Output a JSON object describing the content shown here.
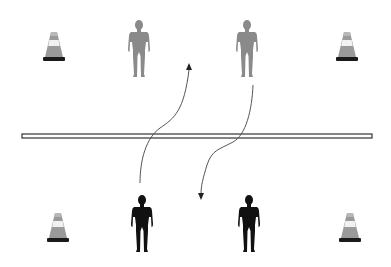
{
  "diagram": {
    "colors": {
      "background": "#ffffff",
      "player_top": "#8a8a8a",
      "player_bottom": "#111111",
      "net_fill": "#ffffff",
      "net_stroke": "#333333",
      "path": "#555555",
      "cone_base": "#1a1a1a",
      "cone_body": "#9a9a9a",
      "cone_band": "#f2f2f2"
    },
    "cones": [
      {
        "id": "top-left",
        "x": 54,
        "y": 48
      },
      {
        "id": "top-right",
        "x": 347,
        "y": 48
      },
      {
        "id": "bottom-left",
        "x": 58,
        "y": 229
      },
      {
        "id": "bottom-right",
        "x": 350,
        "y": 229
      }
    ],
    "players": [
      {
        "id": "top-left-player",
        "team": "top",
        "x": 139,
        "y": 46
      },
      {
        "id": "top-right-player",
        "team": "top",
        "x": 247,
        "y": 46
      },
      {
        "id": "bottom-left-player",
        "team": "bottom",
        "x": 142,
        "y": 221
      },
      {
        "id": "bottom-right-player",
        "team": "bottom",
        "x": 249,
        "y": 221
      }
    ],
    "net": {
      "x": 22,
      "y": 134,
      "width": 350,
      "height": 4
    },
    "paths": [
      {
        "id": "run-bottom-left-to-top",
        "from": "bottom-left-player",
        "direction": "up"
      },
      {
        "id": "run-top-right-to-bottom",
        "from": "top-right-player",
        "direction": "down"
      }
    ]
  }
}
